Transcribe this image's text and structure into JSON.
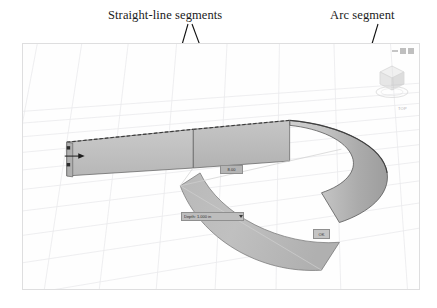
{
  "annotations": {
    "straight_label": "Straight-line segments",
    "arc_label": "Arc segment"
  },
  "viewport": {
    "nav_widget_name": "view-cube",
    "compass_label": "TOP",
    "toolbar_buttons": [
      "minimize",
      "restore",
      "close"
    ]
  },
  "dimension_widgets": {
    "top_chip": "8.00",
    "input_chip": "Depth: 1.000 in",
    "corner_chip": "OK"
  },
  "colors": {
    "face_light": "#c8c8c8",
    "face_mid": "#b6b6b6",
    "face_dark": "#a2a2a2",
    "edge": "#4a4a4a",
    "grid": "#e8e8ea",
    "viewport_bg": "#fefefe",
    "frame_border": "#dededf",
    "leader": "#111111"
  }
}
